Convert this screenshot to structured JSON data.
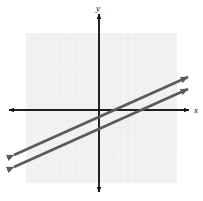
{
  "figure": {
    "width": 203,
    "height": 201,
    "background_color": "#ffffff"
  },
  "axes": {
    "origin": {
      "x": 99,
      "y": 110
    },
    "x_label": "x",
    "y_label": "y",
    "axis_color": "#111111",
    "x_axis": {
      "x_start": 9,
      "x_end": 189,
      "y": 110
    },
    "y_axis": {
      "y_start": 14,
      "y_end": 192,
      "x": 99
    },
    "arrowheads": [
      "x-left",
      "x-right",
      "y-up",
      "y-down"
    ]
  },
  "grid": {
    "color": "#ebebeb",
    "background_color": "#f2f2f2",
    "left": 26,
    "top": 33,
    "right": 177,
    "bottom": 183,
    "cell_size": 7.5,
    "visible": true
  },
  "chart_data": {
    "type": "line",
    "xlabel": "x",
    "ylabel": "y",
    "grid": true,
    "legend": false,
    "xlim": [
      -12,
      12
    ],
    "ylim": [
      -11,
      13
    ],
    "origin_px": {
      "x": 99,
      "y": 110
    },
    "unit_px": 7.5,
    "series": [
      {
        "name": "line-upper",
        "slope": 0.45,
        "y_intercept": -0.9,
        "color": "#5a5a5a",
        "arrows": "both",
        "points_px": [
          {
            "x": 14,
            "y": 155
          },
          {
            "x": 188,
            "y": 77
          }
        ]
      },
      {
        "name": "line-lower",
        "slope": 0.45,
        "y_intercept": -2.7,
        "color": "#5a5a5a",
        "arrows": "both",
        "points_px": [
          {
            "x": 14,
            "y": 167
          },
          {
            "x": 188,
            "y": 89
          }
        ]
      }
    ]
  }
}
